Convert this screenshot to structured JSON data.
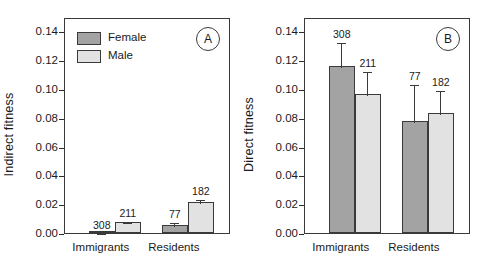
{
  "figure": {
    "panels": [
      "A",
      "B"
    ]
  },
  "legend": {
    "position": "top-left-panel-a",
    "entries": [
      {
        "label": "Female",
        "color": "#a3a3a3"
      },
      {
        "label": "Male",
        "color": "#e2e2e2"
      }
    ]
  },
  "chart_data": [
    {
      "type": "bar",
      "panel_label": "A",
      "title": "",
      "xlabel": "",
      "ylabel": "Indirect fitness",
      "ylim": [
        0.0,
        0.15
      ],
      "yticks": [
        0.0,
        0.02,
        0.04,
        0.06,
        0.08,
        0.1,
        0.12,
        0.14
      ],
      "ytick_labels": [
        "0.00",
        "0.02",
        "0.04",
        "0.06",
        "0.08",
        "0.10",
        "0.12",
        "0.14"
      ],
      "grid": false,
      "legend_position": "upper left",
      "categories": [
        "Immigrants",
        "Residents"
      ],
      "series": [
        {
          "name": "Female",
          "color": "#a3a3a3",
          "values": [
            0.0005,
            0.0055
          ],
          "errors": [
            0.0005,
            0.0028
          ],
          "annotations": [
            "308",
            "77"
          ]
        },
        {
          "name": "Male",
          "color": "#e2e2e2",
          "values": [
            0.0075,
            0.0212
          ],
          "errors": [
            0.0013,
            0.0033
          ],
          "annotations": [
            "211",
            "182"
          ]
        }
      ]
    },
    {
      "type": "bar",
      "panel_label": "B",
      "title": "",
      "xlabel": "",
      "ylabel": "Direct fitness",
      "ylim": [
        0.0,
        0.15
      ],
      "yticks": [
        0.0,
        0.02,
        0.04,
        0.06,
        0.08,
        0.1,
        0.12,
        0.14
      ],
      "ytick_labels": [
        "0.00",
        "0.02",
        "0.04",
        "0.06",
        "0.08",
        "0.10",
        "0.12",
        "0.14"
      ],
      "grid": false,
      "legend_position": "none",
      "categories": [
        "Immigrants",
        "Residents"
      ],
      "series": [
        {
          "name": "Female",
          "color": "#a3a3a3",
          "values": [
            0.116,
            0.0778
          ],
          "errors": [
            0.0175,
            0.0262
          ],
          "annotations": [
            "308",
            "77"
          ]
        },
        {
          "name": "Male",
          "color": "#e2e2e2",
          "values": [
            0.0963,
            0.0832
          ],
          "errors": [
            0.017,
            0.0168
          ],
          "annotations": [
            "211",
            "182"
          ]
        }
      ]
    }
  ]
}
